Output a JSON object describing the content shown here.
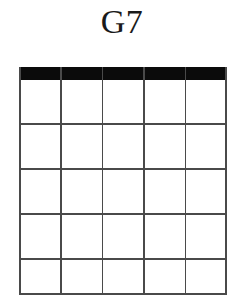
{
  "diagram": {
    "title": "G7",
    "type": "guitar-chord-diagram",
    "instrument": "guitar",
    "strings": 6,
    "frets": 5,
    "nut_shown": true,
    "has_finger_dots": false,
    "has_open_markers": false,
    "has_muted_markers": false,
    "base_fret_label": "",
    "finger_positions": [],
    "open_strings": [],
    "muted_strings": [],
    "string_labels": [],
    "fret_labels": [],
    "colors": {
      "background": "#ffffff",
      "nut": "#0b0b0b",
      "grid_line": "#4a4a4a",
      "title_text": "#1a1a1a"
    }
  }
}
